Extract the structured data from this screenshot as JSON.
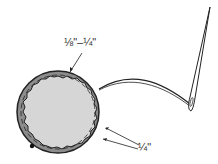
{
  "diagram": {
    "labels": {
      "top_margin": "⅛\"–¼\"",
      "bottom_margin": "¼\""
    },
    "colors": {
      "outer_ring": "#8c8c8c",
      "inner_fill": "#d6d6d6",
      "outline": "#222222",
      "background": "#ffffff"
    },
    "parts": [
      "fabric-circle",
      "seam-allowance-ring",
      "gathering-stitch",
      "thread",
      "needle"
    ]
  }
}
